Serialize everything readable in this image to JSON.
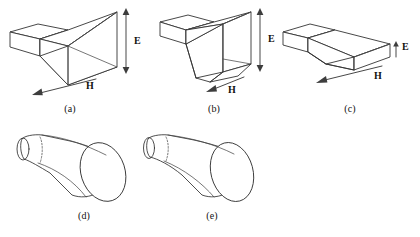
{
  "figure": {
    "background_color": "#ffffff",
    "line_color": "#333333",
    "text_color": "#111111"
  },
  "panels": [
    {
      "id": "a",
      "caption": "(a)",
      "antenna_type": "pyramidal horn",
      "feed": "rectangular waveguide",
      "field_labels": [
        {
          "name": "E",
          "text": "E",
          "orientation": "vertical",
          "arrow": "double-headed"
        },
        {
          "name": "H",
          "text": "H",
          "orientation": "diagonal-down-left",
          "arrow": "single-headed"
        }
      ]
    },
    {
      "id": "b",
      "caption": "(b)",
      "antenna_type": "E-plane sectoral horn",
      "feed": "rectangular waveguide",
      "field_labels": [
        {
          "name": "E",
          "text": "E",
          "orientation": "vertical",
          "arrow": "double-headed"
        },
        {
          "name": "H",
          "text": "H",
          "orientation": "diagonal-down-left",
          "arrow": "single-headed"
        }
      ]
    },
    {
      "id": "c",
      "caption": "(c)",
      "antenna_type": "H-plane sectoral horn",
      "feed": "rectangular waveguide",
      "field_labels": [
        {
          "name": "E",
          "text": "E",
          "orientation": "vertical",
          "arrow": "single-headed-short"
        },
        {
          "name": "H",
          "text": "H",
          "orientation": "diagonal-down-left",
          "arrow": "single-headed"
        }
      ]
    },
    {
      "id": "d",
      "caption": "(d)",
      "antenna_type": "conical horn",
      "feed": "circular waveguide",
      "field_labels": []
    },
    {
      "id": "e",
      "caption": "(e)",
      "antenna_type": "exponential / flared conical horn",
      "feed": "circular waveguide",
      "field_labels": []
    }
  ]
}
